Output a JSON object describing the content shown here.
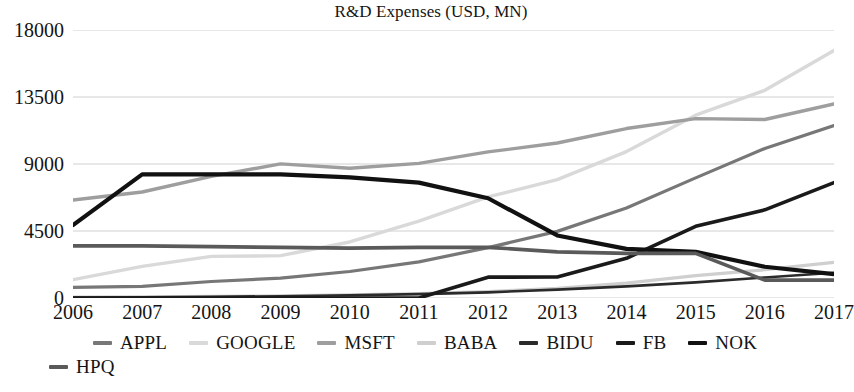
{
  "chart_data": {
    "type": "line",
    "title": "R&D Expenses (USD, MN)",
    "xlabel": "",
    "ylabel": "",
    "categories": [
      "2006",
      "2007",
      "2008",
      "2009",
      "2010",
      "2011",
      "2012",
      "2013",
      "2014",
      "2015",
      "2016",
      "2017"
    ],
    "x": [
      2006,
      2007,
      2008,
      2009,
      2010,
      2011,
      2012,
      2013,
      2014,
      2015,
      2016,
      2017
    ],
    "ylim": [
      0,
      18000
    ],
    "yticks": [
      0,
      4500,
      9000,
      13500,
      18000
    ],
    "ytick_labels": [
      "0",
      "4500",
      "9000",
      "13500",
      "18000"
    ],
    "grid": true,
    "legend_position": "bottom",
    "series": [
      {
        "name": "APPL",
        "color": "#777777",
        "width": 3.2,
        "values": [
          712,
          782,
          1109,
          1333,
          1782,
          2429,
          3381,
          4475,
          6041,
          8067,
          10045,
          11581
        ]
      },
      {
        "name": "GOOGLE",
        "color": "#d9d9d9",
        "width": 3.4,
        "values": [
          1229,
          2120,
          2793,
          2843,
          3762,
          5162,
          6793,
          7952,
          9832,
          12282,
          13948,
          16625
        ]
      },
      {
        "name": "MSFT",
        "color": "#9e9e9e",
        "width": 3.4,
        "values": [
          6584,
          7121,
          8164,
          9010,
          8714,
          9043,
          9811,
          10411,
          11381,
          12046,
          11988,
          13037
        ]
      },
      {
        "name": "BABA",
        "color": "#cfcfcf",
        "width": 3.2,
        "values": [
          60,
          80,
          110,
          150,
          210,
          300,
          430,
          640,
          1000,
          1500,
          1900,
          2400
        ]
      },
      {
        "name": "BIDU",
        "color": "#2b2b2b",
        "width": 2.6,
        "values": [
          30,
          50,
          80,
          120,
          180,
          260,
          380,
          560,
          780,
          1050,
          1380,
          1700
        ]
      },
      {
        "name": "FB",
        "color": "#1a1a1a",
        "width": 3.6,
        "values": [
          0,
          0,
          0,
          0,
          0,
          0,
          1399,
          1415,
          2666,
          4816,
          5919,
          7754
        ]
      },
      {
        "name": "NOK",
        "color": "#111111",
        "width": 4.2,
        "values": [
          4900,
          8300,
          8300,
          8300,
          8100,
          7750,
          6700,
          4200,
          3300,
          3100,
          2100,
          1600
        ]
      },
      {
        "name": "HPQ",
        "color": "#5a5a5a",
        "width": 3.6,
        "values": [
          3500,
          3500,
          3450,
          3400,
          3350,
          3400,
          3400,
          3100,
          3000,
          3000,
          1200,
          1200
        ]
      }
    ]
  },
  "legend": {
    "items": [
      {
        "label": "APPL",
        "color": "#777777"
      },
      {
        "label": "GOOGLE",
        "color": "#d9d9d9"
      },
      {
        "label": "MSFT",
        "color": "#9e9e9e"
      },
      {
        "label": "BABA",
        "color": "#cfcfcf"
      },
      {
        "label": "BIDU",
        "color": "#2b2b2b"
      },
      {
        "label": "FB",
        "color": "#1a1a1a"
      },
      {
        "label": "NOK",
        "color": "#111111"
      },
      {
        "label": "HPQ",
        "color": "#5a5a5a"
      }
    ]
  },
  "style": {
    "background": "#ffffff",
    "grid_color": "#d0d0d0",
    "text_color": "#141414"
  }
}
